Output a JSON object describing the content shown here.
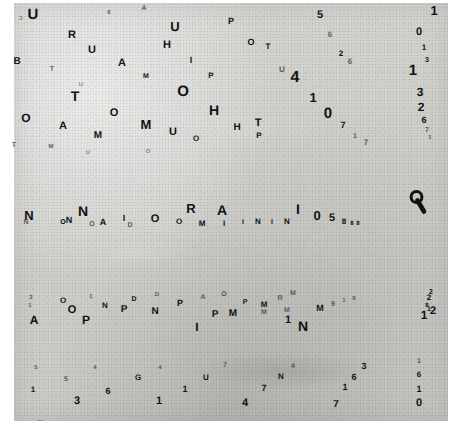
{
  "plate": {
    "description": "grainy grayscale resolution test plate with scattered letters and digits",
    "background_color": "#cdcdca",
    "ink_color": "#121212",
    "paper_color": "#ffffff"
  },
  "marks": [
    {
      "t": "U",
      "x": 33,
      "y": 14,
      "s": 15,
      "c": "ink"
    },
    {
      "t": "3",
      "x": 21,
      "y": 19,
      "s": 6,
      "c": "vfaint"
    },
    {
      "t": "A",
      "x": 144,
      "y": 8,
      "s": 7,
      "c": "faint"
    },
    {
      "t": "6",
      "x": 109,
      "y": 13,
      "s": 6,
      "c": "faint"
    },
    {
      "t": "5",
      "x": 320,
      "y": 15,
      "s": 11,
      "c": "ink"
    },
    {
      "t": "1",
      "x": 434,
      "y": 10,
      "s": 13,
      "c": "ink"
    },
    {
      "t": "P",
      "x": 231,
      "y": 21,
      "s": 9,
      "c": "ink"
    },
    {
      "t": "U",
      "x": 175,
      "y": 26,
      "s": 13,
      "c": "ink"
    },
    {
      "t": "R",
      "x": 72,
      "y": 35,
      "s": 11,
      "c": "ink"
    },
    {
      "t": "6",
      "x": 330,
      "y": 35,
      "s": 8,
      "c": "faint"
    },
    {
      "t": "0",
      "x": 419,
      "y": 32,
      "s": 11,
      "c": "ink"
    },
    {
      "t": "O",
      "x": 251,
      "y": 42,
      "s": 9,
      "c": "ink"
    },
    {
      "t": "T",
      "x": 268,
      "y": 47,
      "s": 8,
      "c": "ink"
    },
    {
      "t": "H",
      "x": 167,
      "y": 45,
      "s": 11,
      "c": "ink"
    },
    {
      "t": "U",
      "x": 92,
      "y": 50,
      "s": 11,
      "c": "ink"
    },
    {
      "t": "2",
      "x": 341,
      "y": 54,
      "s": 8,
      "c": "ink"
    },
    {
      "t": "1",
      "x": 424,
      "y": 48,
      "s": 8,
      "c": "ink"
    },
    {
      "t": "3",
      "x": 427,
      "y": 60,
      "s": 7,
      "c": "ink"
    },
    {
      "t": "B",
      "x": 17,
      "y": 62,
      "s": 10,
      "c": "ink"
    },
    {
      "t": "A",
      "x": 122,
      "y": 63,
      "s": 11,
      "c": "ink"
    },
    {
      "t": "I",
      "x": 191,
      "y": 60,
      "s": 9,
      "c": "ink"
    },
    {
      "t": "U",
      "x": 282,
      "y": 70,
      "s": 8,
      "c": "faint"
    },
    {
      "t": "6",
      "x": 350,
      "y": 62,
      "s": 8,
      "c": "faint"
    },
    {
      "t": "1",
      "x": 413,
      "y": 70,
      "s": 15,
      "c": "ink"
    },
    {
      "t": "T",
      "x": 52,
      "y": 69,
      "s": 7,
      "c": "faint"
    },
    {
      "t": "M",
      "x": 146,
      "y": 76,
      "s": 7,
      "c": "ink"
    },
    {
      "t": "P",
      "x": 211,
      "y": 76,
      "s": 8,
      "c": "ink"
    },
    {
      "t": "4",
      "x": 295,
      "y": 78,
      "s": 16,
      "c": "ink"
    },
    {
      "t": "U",
      "x": 81,
      "y": 85,
      "s": 6,
      "c": "vfaint"
    },
    {
      "t": "O",
      "x": 183,
      "y": 91,
      "s": 15,
      "c": "ink"
    },
    {
      "t": "T",
      "x": 75,
      "y": 96,
      "s": 14,
      "c": "ink"
    },
    {
      "t": "3",
      "x": 420,
      "y": 92,
      "s": 12,
      "c": "ink"
    },
    {
      "t": "1",
      "x": 313,
      "y": 97,
      "s": 13,
      "c": "ink"
    },
    {
      "t": "H",
      "x": 214,
      "y": 110,
      "s": 14,
      "c": "ink"
    },
    {
      "t": "O",
      "x": 114,
      "y": 113,
      "s": 11,
      "c": "ink"
    },
    {
      "t": "2",
      "x": 421,
      "y": 107,
      "s": 12,
      "c": "ink"
    },
    {
      "t": "0",
      "x": 328,
      "y": 113,
      "s": 15,
      "c": "ink"
    },
    {
      "t": "O",
      "x": 26,
      "y": 118,
      "s": 12,
      "c": "ink"
    },
    {
      "t": "M",
      "x": 146,
      "y": 124,
      "s": 13,
      "c": "ink"
    },
    {
      "t": "T",
      "x": 258,
      "y": 123,
      "s": 11,
      "c": "ink"
    },
    {
      "t": "6",
      "x": 424,
      "y": 120,
      "s": 9,
      "c": "ink"
    },
    {
      "t": "A",
      "x": 63,
      "y": 126,
      "s": 11,
      "c": "ink"
    },
    {
      "t": "U",
      "x": 173,
      "y": 132,
      "s": 11,
      "c": "ink"
    },
    {
      "t": "H",
      "x": 237,
      "y": 128,
      "s": 10,
      "c": "ink"
    },
    {
      "t": "7",
      "x": 343,
      "y": 125,
      "s": 9,
      "c": "ink"
    },
    {
      "t": "7",
      "x": 427,
      "y": 130,
      "s": 7,
      "c": "faint"
    },
    {
      "t": "1",
      "x": 430,
      "y": 138,
      "s": 6,
      "c": "faint"
    },
    {
      "t": "M",
      "x": 98,
      "y": 136,
      "s": 10,
      "c": "ink"
    },
    {
      "t": "P",
      "x": 259,
      "y": 136,
      "s": 8,
      "c": "ink"
    },
    {
      "t": "O",
      "x": 196,
      "y": 139,
      "s": 8,
      "c": "ink"
    },
    {
      "t": "1",
      "x": 355,
      "y": 136,
      "s": 7,
      "c": "faint"
    },
    {
      "t": "7",
      "x": 366,
      "y": 143,
      "s": 8,
      "c": "faint"
    },
    {
      "t": "T",
      "x": 14,
      "y": 145,
      "s": 7,
      "c": "faint"
    },
    {
      "t": "M",
      "x": 51,
      "y": 147,
      "s": 6,
      "c": "faint"
    },
    {
      "t": "U",
      "x": 88,
      "y": 153,
      "s": 6,
      "c": "vfaint"
    },
    {
      "t": "O",
      "x": 148,
      "y": 152,
      "s": 6,
      "c": "vfaint"
    },
    {
      "t": "N",
      "x": 29,
      "y": 215,
      "s": 13,
      "c": "ink"
    },
    {
      "t": "N",
      "x": 26,
      "y": 222,
      "s": 7,
      "c": "faint"
    },
    {
      "t": "N",
      "x": 83,
      "y": 211,
      "s": 14,
      "c": "ink"
    },
    {
      "t": "O",
      "x": 63,
      "y": 222,
      "s": 7,
      "c": "ink"
    },
    {
      "t": "N",
      "x": 69,
      "y": 220,
      "s": 9,
      "c": "ink"
    },
    {
      "t": "O",
      "x": 92,
      "y": 224,
      "s": 7,
      "c": "faint"
    },
    {
      "t": "A",
      "x": 103,
      "y": 222,
      "s": 9,
      "c": "ink"
    },
    {
      "t": "I",
      "x": 124,
      "y": 218,
      "s": 9,
      "c": "ink"
    },
    {
      "t": "D",
      "x": 130,
      "y": 225,
      "s": 7,
      "c": "faint"
    },
    {
      "t": "O",
      "x": 155,
      "y": 219,
      "s": 11,
      "c": "ink"
    },
    {
      "t": "R",
      "x": 191,
      "y": 208,
      "s": 13,
      "c": "ink"
    },
    {
      "t": "O",
      "x": 179,
      "y": 222,
      "s": 8,
      "c": "ink"
    },
    {
      "t": "M",
      "x": 202,
      "y": 224,
      "s": 8,
      "c": "ink"
    },
    {
      "t": "A",
      "x": 222,
      "y": 210,
      "s": 14,
      "c": "ink"
    },
    {
      "t": "I",
      "x": 224,
      "y": 224,
      "s": 8,
      "c": "ink"
    },
    {
      "t": "I",
      "x": 243,
      "y": 222,
      "s": 7,
      "c": "ink"
    },
    {
      "t": "N",
      "x": 258,
      "y": 222,
      "s": 8,
      "c": "ink"
    },
    {
      "t": "I",
      "x": 272,
      "y": 222,
      "s": 7,
      "c": "ink"
    },
    {
      "t": "N",
      "x": 287,
      "y": 222,
      "s": 8,
      "c": "ink"
    },
    {
      "t": "I",
      "x": 298,
      "y": 209,
      "s": 14,
      "c": "ink"
    },
    {
      "t": "0",
      "x": 317,
      "y": 215,
      "s": 13,
      "c": "ink"
    },
    {
      "t": "5",
      "x": 332,
      "y": 218,
      "s": 11,
      "c": "ink"
    },
    {
      "t": "8",
      "x": 344,
      "y": 222,
      "s": 8,
      "c": "ink"
    },
    {
      "t": "8",
      "x": 352,
      "y": 224,
      "s": 6,
      "c": "ink"
    },
    {
      "t": "8",
      "x": 358,
      "y": 224,
      "s": 6,
      "c": "ink"
    },
    {
      "t": "3",
      "x": 31,
      "y": 298,
      "s": 6,
      "c": "faint"
    },
    {
      "t": "1",
      "x": 30,
      "y": 306,
      "s": 6,
      "c": "faint"
    },
    {
      "t": "O",
      "x": 63,
      "y": 301,
      "s": 8,
      "c": "ink"
    },
    {
      "t": "1",
      "x": 91,
      "y": 297,
      "s": 6,
      "c": "faint"
    },
    {
      "t": "D",
      "x": 134,
      "y": 299,
      "s": 7,
      "c": "ink"
    },
    {
      "t": "D",
      "x": 157,
      "y": 295,
      "s": 6,
      "c": "faint"
    },
    {
      "t": "A",
      "x": 203,
      "y": 297,
      "s": 7,
      "c": "faint"
    },
    {
      "t": "O",
      "x": 224,
      "y": 294,
      "s": 7,
      "c": "faint"
    },
    {
      "t": "M",
      "x": 293,
      "y": 293,
      "s": 7,
      "c": "faint"
    },
    {
      "t": "R",
      "x": 280,
      "y": 298,
      "s": 7,
      "c": "faint"
    },
    {
      "t": "2",
      "x": 431,
      "y": 292,
      "s": 7,
      "c": "ink"
    },
    {
      "t": "2",
      "x": 429,
      "y": 298,
      "s": 8,
      "c": "ink"
    },
    {
      "t": "O",
      "x": 72,
      "y": 310,
      "s": 11,
      "c": "ink"
    },
    {
      "t": "N",
      "x": 105,
      "y": 306,
      "s": 8,
      "c": "ink"
    },
    {
      "t": "P",
      "x": 180,
      "y": 303,
      "s": 9,
      "c": "ink"
    },
    {
      "t": "N",
      "x": 155,
      "y": 312,
      "s": 10,
      "c": "ink"
    },
    {
      "t": "P",
      "x": 245,
      "y": 302,
      "s": 7,
      "c": "ink"
    },
    {
      "t": "M",
      "x": 264,
      "y": 305,
      "s": 8,
      "c": "ink"
    },
    {
      "t": "8",
      "x": 427,
      "y": 306,
      "s": 6,
      "c": "ink"
    },
    {
      "t": "1",
      "x": 429,
      "y": 309,
      "s": 7,
      "c": "ink"
    },
    {
      "t": "A",
      "x": 34,
      "y": 320,
      "s": 12,
      "c": "ink"
    },
    {
      "t": "P",
      "x": 86,
      "y": 320,
      "s": 12,
      "c": "ink"
    },
    {
      "t": "P",
      "x": 124,
      "y": 310,
      "s": 10,
      "c": "ink"
    },
    {
      "t": "M",
      "x": 264,
      "y": 312,
      "s": 7,
      "c": "faint"
    },
    {
      "t": "M",
      "x": 233,
      "y": 314,
      "s": 10,
      "c": "ink"
    },
    {
      "t": "P",
      "x": 215,
      "y": 315,
      "s": 10,
      "c": "ink"
    },
    {
      "t": "M",
      "x": 320,
      "y": 308,
      "s": 9,
      "c": "ink"
    },
    {
      "t": "9",
      "x": 333,
      "y": 304,
      "s": 7,
      "c": "faint"
    },
    {
      "t": "1",
      "x": 344,
      "y": 301,
      "s": 6,
      "c": "faint"
    },
    {
      "t": "9",
      "x": 354,
      "y": 299,
      "s": 6,
      "c": "faint"
    },
    {
      "t": "1",
      "x": 424,
      "y": 315,
      "s": 12,
      "c": "ink"
    },
    {
      "t": "2",
      "x": 433,
      "y": 311,
      "s": 11,
      "c": "ink"
    },
    {
      "t": "I",
      "x": 197,
      "y": 327,
      "s": 12,
      "c": "ink"
    },
    {
      "t": "1",
      "x": 288,
      "y": 320,
      "s": 11,
      "c": "ink"
    },
    {
      "t": "N",
      "x": 303,
      "y": 326,
      "s": 14,
      "c": "ink"
    },
    {
      "t": "M",
      "x": 287,
      "y": 310,
      "s": 7,
      "c": "faint"
    },
    {
      "t": "5",
      "x": 36,
      "y": 368,
      "s": 6,
      "c": "faint"
    },
    {
      "t": "4",
      "x": 95,
      "y": 368,
      "s": 6,
      "c": "faint"
    },
    {
      "t": "4",
      "x": 160,
      "y": 368,
      "s": 6,
      "c": "faint"
    },
    {
      "t": "7",
      "x": 225,
      "y": 365,
      "s": 7,
      "c": "faint"
    },
    {
      "t": "4",
      "x": 293,
      "y": 366,
      "s": 7,
      "c": "faint"
    },
    {
      "t": "1",
      "x": 419,
      "y": 361,
      "s": 7,
      "c": "faint"
    },
    {
      "t": "5",
      "x": 66,
      "y": 379,
      "s": 7,
      "c": "faint"
    },
    {
      "t": "G",
      "x": 138,
      "y": 378,
      "s": 8,
      "c": "ink"
    },
    {
      "t": "U",
      "x": 206,
      "y": 378,
      "s": 8,
      "c": "ink"
    },
    {
      "t": "N",
      "x": 281,
      "y": 377,
      "s": 8,
      "c": "ink"
    },
    {
      "t": "6",
      "x": 419,
      "y": 375,
      "s": 8,
      "c": "ink"
    },
    {
      "t": "1",
      "x": 33,
      "y": 390,
      "s": 8,
      "c": "ink"
    },
    {
      "t": "6",
      "x": 108,
      "y": 391,
      "s": 9,
      "c": "ink"
    },
    {
      "t": "1",
      "x": 185,
      "y": 389,
      "s": 9,
      "c": "ink"
    },
    {
      "t": "1",
      "x": 345,
      "y": 387,
      "s": 9,
      "c": "ink"
    },
    {
      "t": "7",
      "x": 264,
      "y": 388,
      "s": 9,
      "c": "ink"
    },
    {
      "t": "1",
      "x": 419,
      "y": 389,
      "s": 9,
      "c": "ink"
    },
    {
      "t": "3",
      "x": 77,
      "y": 401,
      "s": 11,
      "c": "ink"
    },
    {
      "t": "6",
      "x": 354,
      "y": 377,
      "s": 9,
      "c": "ink"
    },
    {
      "t": "3",
      "x": 364,
      "y": 366,
      "s": 9,
      "c": "ink"
    },
    {
      "t": "1",
      "x": 159,
      "y": 401,
      "s": 11,
      "c": "ink"
    },
    {
      "t": "4",
      "x": 245,
      "y": 403,
      "s": 11,
      "c": "ink"
    },
    {
      "t": "7",
      "x": 336,
      "y": 405,
      "s": 10,
      "c": "ink"
    },
    {
      "t": "0",
      "x": 419,
      "y": 403,
      "s": 11,
      "c": "ink"
    },
    {
      "t": "7",
      "x": 40,
      "y": 425,
      "s": 12,
      "c": "ink"
    },
    {
      "t": "8",
      "x": 131,
      "y": 426,
      "s": 11,
      "c": "ink"
    },
    {
      "t": "9",
      "x": 224,
      "y": 426,
      "s": 11,
      "c": "ink"
    },
    {
      "t": "0",
      "x": 327,
      "y": 427,
      "s": 11,
      "c": "ink"
    },
    {
      "t": "1",
      "x": 430,
      "y": 427,
      "s": 10,
      "c": "ink"
    }
  ],
  "q_mark": {
    "name": "q-glyph",
    "x": 419,
    "y": 202,
    "size": 18
  }
}
